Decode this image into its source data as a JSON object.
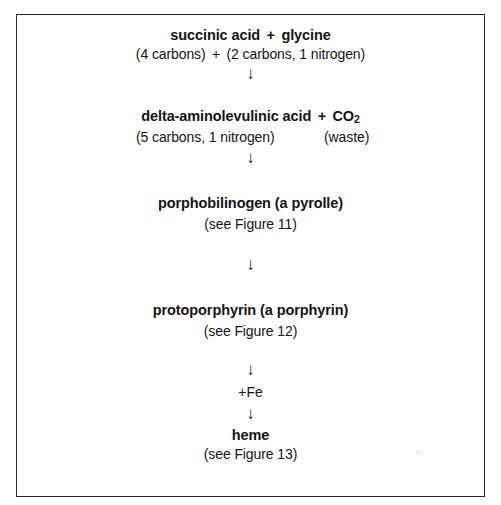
{
  "figure": {
    "type": "biochemical-pathway-diagram",
    "border_color": "#2b2b2b",
    "background_color": "#ffffff",
    "text_color": "#141414",
    "arrow_glyph": "↓",
    "arrow_icon_name": "down-arrow-icon"
  },
  "steps": [
    {
      "id": "step-1",
      "name_parts": {
        "reactant_a": "succinic acid",
        "operator": "+",
        "reactant_b": "glycine"
      },
      "name_plain": "succinic acid + glycine",
      "detail_parts": {
        "left": "(4 carbons)",
        "operator": "+",
        "right": "(2 carbons, 1 nitrogen)"
      },
      "detail_plain": "(4 carbons) + (2 carbons, 1 nitrogen)"
    },
    {
      "id": "step-2",
      "name_parts": {
        "product": "delta-aminolevulinic acid",
        "operator": "+",
        "byproduct": "CO",
        "byproduct_subscript": "2"
      },
      "name_plain": "delta-aminolevulinic acid + CO2",
      "detail_parts": {
        "left": "(5 carbons, 1 nitrogen)",
        "right": "(waste)"
      },
      "detail_plain": "(5 carbons, 1 nitrogen)        (waste)"
    },
    {
      "id": "step-3",
      "name_plain": "porphobilinogen (a pyrolle)",
      "detail_plain": "(see Figure 11)"
    },
    {
      "id": "step-4",
      "name_plain": "protoporphyrin (a porphyrin)",
      "detail_plain": "(see Figure 12)"
    },
    {
      "id": "step-5",
      "name_plain": "heme",
      "detail_plain": "(see Figure 13)"
    }
  ],
  "cofactors": [
    {
      "id": "cofactor-fe",
      "label": "+Fe"
    }
  ],
  "arrows": {
    "glyph": "↓",
    "count": 5
  }
}
